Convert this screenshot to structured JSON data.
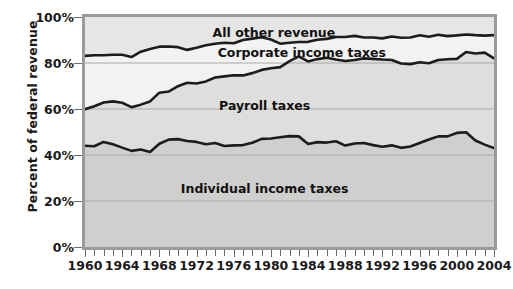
{
  "chart_data": {
    "type": "area",
    "title": "",
    "subtitle": "",
    "xlabel": "",
    "ylabel": "Percent of federal revenue",
    "xlim": [
      1960,
      2004
    ],
    "ylim": [
      0,
      100
    ],
    "grid": true,
    "stacked": true,
    "legend_position": "inline-annotations",
    "ytick_labels": [
      "0%",
      "20%",
      "40%",
      "60%",
      "80%",
      "100%"
    ],
    "ytick_values": [
      0,
      20,
      40,
      60,
      80,
      100
    ],
    "xtick_labels": [
      "1960",
      "1964",
      "1968",
      "1972",
      "1976",
      "1980",
      "1984",
      "1988",
      "1992",
      "1996",
      "2000",
      "2004"
    ],
    "xtick_values": [
      1960,
      1964,
      1968,
      1972,
      1976,
      1980,
      1984,
      1988,
      1992,
      1996,
      2000,
      2004
    ],
    "xtick_minor_step": 1,
    "x": [
      1960,
      1961,
      1962,
      1963,
      1964,
      1965,
      1966,
      1967,
      1968,
      1969,
      1970,
      1971,
      1972,
      1973,
      1974,
      1975,
      1976,
      1977,
      1978,
      1979,
      1980,
      1981,
      1982,
      1983,
      1984,
      1985,
      1986,
      1987,
      1988,
      1989,
      1990,
      1991,
      1992,
      1993,
      1994,
      1995,
      1996,
      1997,
      1998,
      1999,
      2000,
      2001,
      2002,
      2003,
      2004
    ],
    "series": [
      {
        "name": "Individual income taxes",
        "fill": "#cfcfcd",
        "values": [
          44.0,
          43.8,
          45.7,
          44.7,
          43.2,
          41.8,
          42.4,
          41.3,
          44.9,
          46.7,
          46.9,
          46.1,
          45.7,
          44.7,
          45.2,
          43.9,
          44.2,
          44.3,
          45.3,
          47.0,
          47.2,
          47.7,
          48.2,
          48.1,
          44.8,
          45.6,
          45.4,
          46.0,
          44.1,
          45.0,
          45.2,
          44.3,
          43.6,
          44.2,
          43.1,
          43.7,
          45.2,
          46.7,
          48.1,
          48.1,
          49.6,
          49.9,
          46.3,
          44.5,
          43.0
        ]
      },
      {
        "name": "Payroll taxes",
        "fill": "#dededc",
        "values": [
          15.9,
          17.4,
          17.1,
          18.6,
          19.5,
          19.0,
          19.5,
          22.0,
          22.2,
          20.9,
          23.0,
          25.3,
          25.4,
          27.3,
          28.5,
          30.3,
          30.5,
          30.3,
          30.3,
          30.0,
          30.5,
          30.5,
          32.6,
          34.8,
          35.9,
          36.1,
          36.9,
          35.5,
          36.8,
          36.3,
          36.8,
          37.5,
          37.9,
          37.1,
          36.7,
          35.8,
          35.1,
          33.2,
          33.2,
          33.5,
          32.2,
          34.9,
          37.8,
          40.0,
          39.0
        ]
      },
      {
        "name": "Corporate income taxes",
        "fill": "#f2f2f0",
        "values": [
          23.2,
          22.2,
          20.6,
          20.3,
          20.9,
          21.8,
          23.0,
          22.8,
          20.0,
          19.6,
          17.0,
          14.3,
          15.5,
          15.7,
          14.7,
          14.6,
          13.9,
          15.4,
          15.0,
          14.2,
          12.5,
          10.2,
          8.0,
          6.2,
          8.5,
          8.4,
          8.2,
          9.8,
          10.4,
          10.5,
          9.1,
          9.3,
          9.2,
          10.2,
          11.2,
          11.6,
          11.8,
          11.5,
          11.0,
          10.1,
          10.2,
          7.6,
          8.0,
          7.4,
          10.1
        ]
      },
      {
        "name": "All other revenue",
        "fill": "#e6e6e4",
        "values": [
          16.9,
          16.6,
          16.6,
          16.4,
          16.4,
          17.4,
          15.1,
          13.9,
          12.9,
          12.8,
          13.1,
          14.3,
          13.4,
          12.3,
          11.6,
          11.2,
          11.4,
          10.0,
          9.4,
          8.8,
          9.8,
          11.6,
          11.2,
          10.9,
          10.8,
          9.9,
          9.5,
          8.7,
          8.7,
          8.2,
          8.9,
          8.9,
          9.3,
          8.5,
          9.0,
          8.9,
          7.9,
          8.6,
          7.7,
          8.3,
          8.0,
          7.6,
          7.9,
          8.1,
          7.9
        ]
      }
    ],
    "annotations": [
      {
        "text": "All other revenue",
        "x": 1980,
        "y": 95
      },
      {
        "text": "Corporate income taxes",
        "x": 1983,
        "y": 86
      },
      {
        "text": "Payroll taxes",
        "x": 1979,
        "y": 63
      },
      {
        "text": "Individual income taxes",
        "x": 1979,
        "y": 27
      }
    ],
    "colors": {
      "line": "#1c1c1c",
      "grid": "#a8a8a6",
      "axis_border": "#9a9a9a",
      "plot_background": "#efefed",
      "text": "#1a1a1a"
    }
  }
}
